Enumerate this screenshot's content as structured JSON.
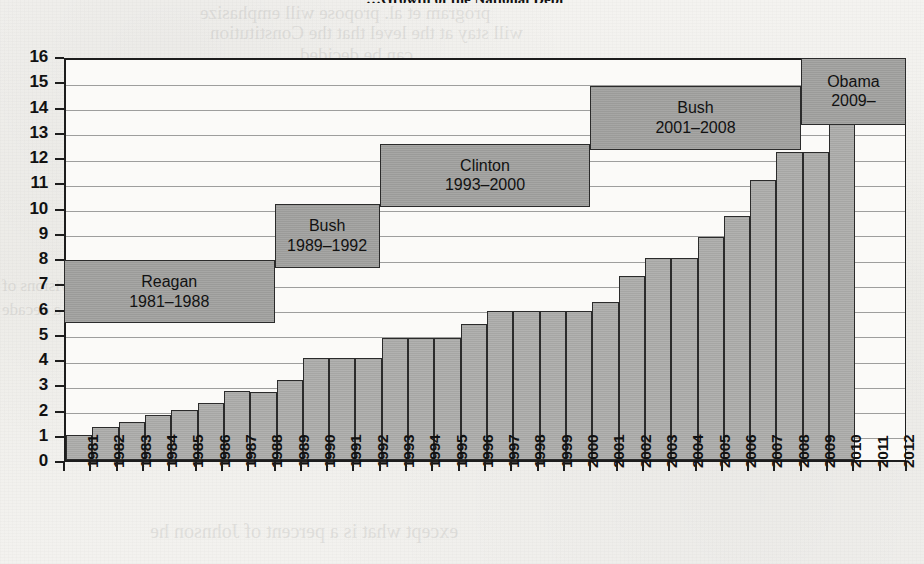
{
  "page": {
    "title_fragment": "…Growth of the National Debt",
    "bleed_text": [
      "program et al. propose will emphasize",
      "will stay at the level that the Constitution",
      "can be decided",
      "Answer as follows",
      "26. Based on this graph",
      "which president added",
      "except what is a percent of Johnson he",
      "of the divisions of",
      "rate by a decade"
    ]
  },
  "chart_data": {
    "type": "bar",
    "title": "…Growth of the National Debt",
    "xlabel": "",
    "ylabel": "",
    "ylim": [
      0,
      16
    ],
    "ytick_labels": [
      "0",
      "1",
      "2",
      "3",
      "4",
      "5",
      "6",
      "7",
      "8",
      "9",
      "10",
      "11",
      "12",
      "13",
      "14",
      "15",
      "16"
    ],
    "grid": true,
    "legend": "none",
    "categories": [
      "1981",
      "1982",
      "1983",
      "1984",
      "1985",
      "1986",
      "1987",
      "1988",
      "1989",
      "1990",
      "1991",
      "1992",
      "1993",
      "1994",
      "1995",
      "1996",
      "1997",
      "1998",
      "1999",
      "2000",
      "2001",
      "2002",
      "2003",
      "2004",
      "2005",
      "2006",
      "2007",
      "2008",
      "2009",
      "2010",
      "2011",
      "2012"
    ],
    "values": [
      1.0,
      1.3,
      1.5,
      1.8,
      2.0,
      2.25,
      2.75,
      2.7,
      3.15,
      4.05,
      4.05,
      4.05,
      4.85,
      4.85,
      4.85,
      5.4,
      5.9,
      5.9,
      5.9,
      5.9,
      6.25,
      7.3,
      8.0,
      8.0,
      8.85,
      9.65,
      11.1,
      12.2,
      12.2,
      14.1,
      null,
      null
    ],
    "bar_fill": "#a9a9a7",
    "bar_stroke": "#2b2b2b",
    "annotations": [
      {
        "name": "Reagan",
        "l1": "Reagan",
        "l2": "1981–1988",
        "x_start": "1981",
        "x_end": "1988",
        "y_bottom": 5.5,
        "y_top": 8.0
      },
      {
        "name": "Bush41",
        "l1": "Bush",
        "l2": "1989–1992",
        "x_start": "1989",
        "x_end": "1992",
        "y_bottom": 7.7,
        "y_top": 10.2
      },
      {
        "name": "Clinton",
        "l1": "Clinton",
        "l2": "1993–2000",
        "x_start": "1993",
        "x_end": "2000",
        "y_bottom": 10.1,
        "y_top": 12.6
      },
      {
        "name": "Bush43",
        "l1": "Bush",
        "l2": "2001–2008",
        "x_start": "2001",
        "x_end": "2008",
        "y_bottom": 12.35,
        "y_top": 14.9
      },
      {
        "name": "Obama",
        "l1": "Obama",
        "l2": "2009–",
        "x_start": "2009",
        "x_end": "2012",
        "y_bottom": 13.35,
        "y_top": 16.0
      }
    ]
  }
}
